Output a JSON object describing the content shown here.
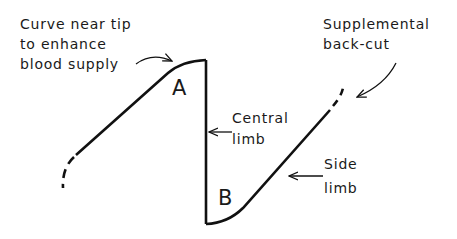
{
  "diagram": {
    "type": "flap-incision-schematic",
    "labels": {
      "curve_note": [
        "Curve near tip",
        "to enhance",
        "blood supply"
      ],
      "supplemental": [
        "Supplemental",
        "back-cut"
      ],
      "central_limb": [
        "Central",
        "limb"
      ],
      "side_limb": [
        "Side",
        "limb"
      ],
      "point_a": "A",
      "point_b": "B"
    },
    "colors": {
      "line": "#111111",
      "text": "#1a1a1a",
      "background": "#ffffff"
    }
  }
}
